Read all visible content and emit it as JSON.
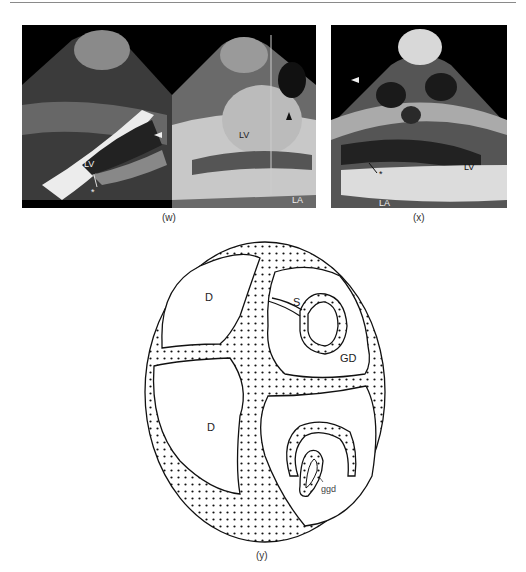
{
  "figure": {
    "panels": [
      {
        "id": "w",
        "caption": "(w)",
        "type": "echocardiogram",
        "labels": {
          "lv_left": "LV",
          "lv_right": "LV",
          "la": "LA",
          "asterisk": "*"
        }
      },
      {
        "id": "x",
        "caption": "(x)",
        "type": "echocardiogram",
        "labels": {
          "lv": "LV",
          "la": "LA",
          "asterisk": "*"
        }
      },
      {
        "id": "y",
        "caption": "(y)",
        "type": "schematic-diagram",
        "labels": {
          "d_upper": "D",
          "d_lower": "D",
          "s": "S",
          "gd": "GD",
          "ggd": "ggd"
        }
      }
    ]
  }
}
